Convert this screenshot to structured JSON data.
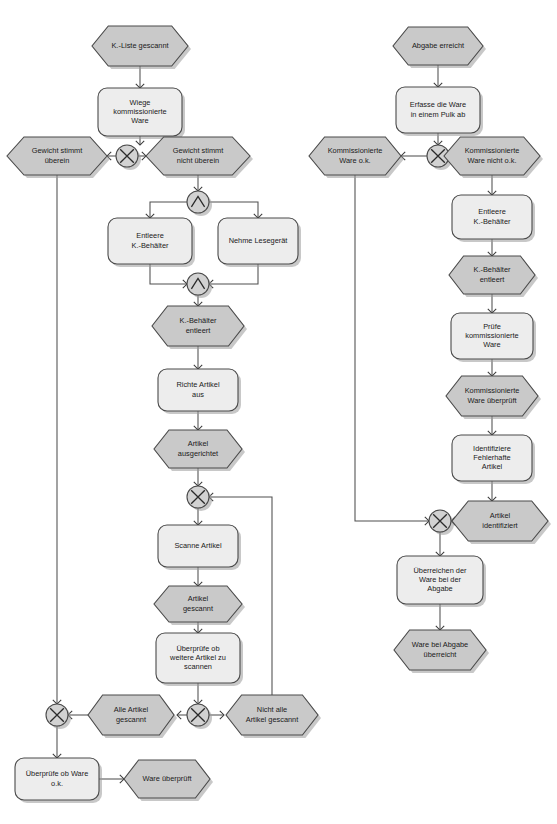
{
  "diagram": {
    "type": "epc-event-driven-process-chain",
    "title": "",
    "language": "de",
    "legend": {
      "event_shape": "hexagon",
      "function_shape": "rounded-rectangle",
      "connector_xor": "X",
      "connector_and": "^"
    },
    "colors": {
      "event_fill": "#c9c9c9",
      "function_fill": "#ededed",
      "connector_fill": "#d2d2d2",
      "outline": "#4a4a4a",
      "edge": "#4f4f4f",
      "text": "#1a1a1a",
      "background": "#ffffff"
    },
    "nodes": [
      {
        "id": "e1",
        "kind": "event",
        "label": "K.-Liste gescannt",
        "x": 140,
        "y": 46,
        "w": 96,
        "h": 40
      },
      {
        "id": "f1",
        "kind": "function",
        "label": "Wiege kommissionierte Ware",
        "x": 140,
        "y": 112,
        "w": 84,
        "h": 48
      },
      {
        "id": "x1",
        "kind": "xor",
        "label": "X",
        "x": 127,
        "y": 156,
        "w": 22,
        "h": 22
      },
      {
        "id": "e2",
        "kind": "event",
        "label": "Gewicht stimmt überein",
        "x": 57,
        "y": 156,
        "w": 100,
        "h": 38
      },
      {
        "id": "e3",
        "kind": "event",
        "label": "Gewicht stimmt nicht überein",
        "x": 198,
        "y": 156,
        "w": 104,
        "h": 38
      },
      {
        "id": "a1",
        "kind": "and",
        "label": "AND",
        "x": 198,
        "y": 202,
        "w": 22,
        "h": 22
      },
      {
        "id": "f2",
        "kind": "function",
        "label": "Entleere K.-Behälter",
        "x": 150,
        "y": 241,
        "w": 84,
        "h": 46
      },
      {
        "id": "f3",
        "kind": "function",
        "label": "Nehme Lesegerät",
        "x": 258,
        "y": 241,
        "w": 80,
        "h": 46
      },
      {
        "id": "a2",
        "kind": "and",
        "label": "AND",
        "x": 198,
        "y": 284,
        "w": 22,
        "h": 22
      },
      {
        "id": "e4",
        "kind": "event",
        "label": "K.-Behälter entleert",
        "x": 198,
        "y": 326,
        "w": 92,
        "h": 40
      },
      {
        "id": "f4",
        "kind": "function",
        "label": "Richte Artikel aus",
        "x": 198,
        "y": 390,
        "w": 80,
        "h": 42
      },
      {
        "id": "e5",
        "kind": "event",
        "label": "Artikel ausgerichtet",
        "x": 198,
        "y": 449,
        "w": 88,
        "h": 38
      },
      {
        "id": "x2",
        "kind": "xor",
        "label": "X",
        "x": 198,
        "y": 497,
        "w": 22,
        "h": 22
      },
      {
        "id": "f5",
        "kind": "function",
        "label": "Scanne Artikel",
        "x": 198,
        "y": 546,
        "w": 80,
        "h": 42
      },
      {
        "id": "e6",
        "kind": "event",
        "label": "Artikel gescannt",
        "x": 198,
        "y": 604,
        "w": 88,
        "h": 36
      },
      {
        "id": "f6",
        "kind": "function",
        "label": "Überprüfe ob weitere Artikel zu scannen",
        "x": 198,
        "y": 658,
        "w": 84,
        "h": 50
      },
      {
        "id": "x3",
        "kind": "xor",
        "label": "X",
        "x": 198,
        "y": 715,
        "w": 22,
        "h": 22
      },
      {
        "id": "e7",
        "kind": "event",
        "label": "Alle Artikel gescannt",
        "x": 131,
        "y": 715,
        "w": 86,
        "h": 40
      },
      {
        "id": "e8",
        "kind": "event",
        "label": "Nicht alle Artikel gescannt",
        "x": 272,
        "y": 715,
        "w": 92,
        "h": 40
      },
      {
        "id": "x4",
        "kind": "xor",
        "label": "X",
        "x": 57,
        "y": 715,
        "w": 22,
        "h": 22
      },
      {
        "id": "f7",
        "kind": "function",
        "label": "Überprüfe ob Ware o.k.",
        "x": 57,
        "y": 779,
        "w": 84,
        "h": 42
      },
      {
        "id": "e9",
        "kind": "event",
        "label": "Ware überprüft",
        "x": 167,
        "y": 779,
        "w": 86,
        "h": 38
      },
      {
        "id": "e10",
        "kind": "event",
        "label": "Abgabe erreicht",
        "x": 438,
        "y": 46,
        "w": 90,
        "h": 38
      },
      {
        "id": "f8",
        "kind": "function",
        "label": "Erfasse die Ware in einem Pulk ab",
        "x": 438,
        "y": 110,
        "w": 84,
        "h": 46
      },
      {
        "id": "x5",
        "kind": "xor",
        "label": "X",
        "x": 438,
        "y": 156,
        "w": 22,
        "h": 22
      },
      {
        "id": "e11",
        "kind": "event",
        "label": "Kommissionierte Ware o.k.",
        "x": 355,
        "y": 156,
        "w": 92,
        "h": 38
      },
      {
        "id": "e12",
        "kind": "event",
        "label": "Kommissionierte Ware nicht o.k.",
        "x": 492,
        "y": 156,
        "w": 96,
        "h": 38
      },
      {
        "id": "f9",
        "kind": "function",
        "label": "Entleere K.-Behälter",
        "x": 492,
        "y": 217,
        "w": 80,
        "h": 44
      },
      {
        "id": "e13",
        "kind": "event",
        "label": "K.-Behälter entleert",
        "x": 492,
        "y": 275,
        "w": 86,
        "h": 38
      },
      {
        "id": "f10",
        "kind": "function",
        "label": "Prüfe kommissionierte Ware",
        "x": 492,
        "y": 336,
        "w": 82,
        "h": 46
      },
      {
        "id": "e14",
        "kind": "event",
        "label": "Kommissionierte Ware überprüft",
        "x": 492,
        "y": 396,
        "w": 92,
        "h": 40
      },
      {
        "id": "f11",
        "kind": "function",
        "label": "Identifiziere Fehlerhafte Artikel",
        "x": 492,
        "y": 458,
        "w": 80,
        "h": 46
      },
      {
        "id": "x6",
        "kind": "xor",
        "label": "X",
        "x": 440,
        "y": 521,
        "w": 22,
        "h": 22
      },
      {
        "id": "e15",
        "kind": "event",
        "label": "Artikel identifiziert",
        "x": 500,
        "y": 521,
        "w": 96,
        "h": 40
      },
      {
        "id": "f12",
        "kind": "function",
        "label": "Überreichen der Ware bei der Abgabe",
        "x": 440,
        "y": 580,
        "w": 86,
        "h": 48
      },
      {
        "id": "e16",
        "kind": "event",
        "label": "Ware bei Abgabe überreicht",
        "x": 440,
        "y": 650,
        "w": 92,
        "h": 40
      }
    ],
    "edges": [
      {
        "from": "e1",
        "to": "f1",
        "path": "M140,66 L140,88",
        "arrow": "down"
      },
      {
        "from": "f1",
        "to": "x1",
        "path": "M140,136 L140,145",
        "arrow": "down"
      },
      {
        "from": "x1",
        "to": "e2",
        "path": "M116,156 L107,156",
        "arrow": "left"
      },
      {
        "from": "x1",
        "to": "e3",
        "path": "M138,156 L146,156",
        "arrow": "right"
      },
      {
        "from": "e3",
        "to": "a1",
        "path": "M198,175 L198,191",
        "arrow": "down"
      },
      {
        "from": "a1",
        "to": "f2",
        "path": "M187,202 L150,202 L150,218",
        "arrow": "down"
      },
      {
        "from": "a1",
        "to": "f3",
        "path": "M209,202 L258,202 L258,218",
        "arrow": "down"
      },
      {
        "from": "f2",
        "to": "a2",
        "path": "M150,264 L150,284 L187,284",
        "arrow": "right"
      },
      {
        "from": "f3",
        "to": "a2",
        "path": "M258,264 L258,284 L209,284",
        "arrow": "left"
      },
      {
        "from": "a2",
        "to": "e4",
        "path": "M198,295 L198,306",
        "arrow": "down"
      },
      {
        "from": "e4",
        "to": "f4",
        "path": "M198,346 L198,369",
        "arrow": "down"
      },
      {
        "from": "f4",
        "to": "e5",
        "path": "M198,411 L198,430",
        "arrow": "down"
      },
      {
        "from": "e5",
        "to": "x2",
        "path": "M198,468 L198,486",
        "arrow": "down"
      },
      {
        "from": "x2",
        "to": "f5",
        "path": "M198,508 L198,525",
        "arrow": "down"
      },
      {
        "from": "f5",
        "to": "e6",
        "path": "M198,567 L198,586",
        "arrow": "down"
      },
      {
        "from": "e6",
        "to": "f6",
        "path": "M198,622 L198,633",
        "arrow": "down"
      },
      {
        "from": "f6",
        "to": "x3",
        "path": "M198,683 L198,704",
        "arrow": "down"
      },
      {
        "from": "x3",
        "to": "e7",
        "path": "M187,715 L177,715",
        "arrow": "left"
      },
      {
        "from": "x3",
        "to": "e8",
        "path": "M209,715 L224,715",
        "arrow": "right"
      },
      {
        "from": "e7",
        "to": "x4",
        "path": "M88,715 L68,715",
        "arrow": "left"
      },
      {
        "from": "e2",
        "to": "x4",
        "path": "M57,175 L57,704",
        "arrow": "down"
      },
      {
        "from": "e8",
        "to": "x2",
        "path": "M272,695 L272,497 L209,497",
        "arrow": "left"
      },
      {
        "from": "x4",
        "to": "f7",
        "path": "M57,726 L57,758",
        "arrow": "down"
      },
      {
        "from": "f7",
        "to": "e9",
        "path": "M99,779 L124,779",
        "arrow": "right"
      },
      {
        "from": "e10",
        "to": "f8",
        "path": "M438,65 L438,87",
        "arrow": "down"
      },
      {
        "from": "f8",
        "to": "x5",
        "path": "M438,133 L438,145",
        "arrow": "down"
      },
      {
        "from": "x5",
        "to": "e11",
        "path": "M427,156 L401,156",
        "arrow": "left"
      },
      {
        "from": "x5",
        "to": "e12",
        "path": "M449,156 L470,156",
        "arrow": "right"
      },
      {
        "from": "e12",
        "to": "f9",
        "path": "M492,175 L492,195",
        "arrow": "down"
      },
      {
        "from": "f9",
        "to": "e13",
        "path": "M492,239 L492,256",
        "arrow": "down"
      },
      {
        "from": "e13",
        "to": "f10",
        "path": "M492,294 L492,313",
        "arrow": "down"
      },
      {
        "from": "f10",
        "to": "e14",
        "path": "M492,359 L492,376",
        "arrow": "down"
      },
      {
        "from": "e14",
        "to": "f11",
        "path": "M492,416 L492,435",
        "arrow": "down"
      },
      {
        "from": "f11",
        "to": "e15",
        "path": "M492,481 L492,501",
        "arrow": "down"
      },
      {
        "from": "e15",
        "to": "x6",
        "path": "M452,521 L451,521",
        "arrow": "left"
      },
      {
        "from": "e11",
        "to": "x6",
        "path": "M355,175 L355,521 L429,521",
        "arrow": "right"
      },
      {
        "from": "x6",
        "to": "f12",
        "path": "M440,532 L440,556",
        "arrow": "down"
      },
      {
        "from": "f12",
        "to": "e16",
        "path": "M440,604 L440,630",
        "arrow": "down"
      }
    ]
  }
}
